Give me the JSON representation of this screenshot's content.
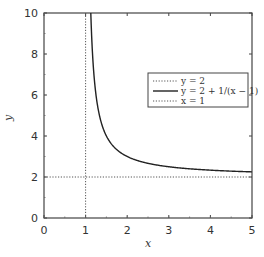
{
  "chart_data": {
    "type": "line",
    "title": "",
    "xlabel": "x",
    "ylabel": "y",
    "xlim": [
      0,
      5
    ],
    "ylim": [
      0,
      10
    ],
    "xticks": [
      0,
      1,
      2,
      3,
      4,
      5
    ],
    "yticks": [
      0,
      2,
      4,
      6,
      8,
      10
    ],
    "grid": false,
    "legend_position": "center-right inside",
    "series": [
      {
        "name": "y = 2",
        "style": "dotted",
        "color": "#555555",
        "kind": "hline",
        "value": 2
      },
      {
        "name": "y = 2 + 1/(x − 1)",
        "style": "solid",
        "color": "#222222",
        "kind": "function",
        "x_range": [
          1.125,
          5
        ]
      },
      {
        "name": "x = 1",
        "style": "dotted",
        "color": "#555555",
        "kind": "vline",
        "value": 1
      }
    ]
  },
  "legend": {
    "items": [
      "y = 2",
      "y = 2 + 1/(x − 1)",
      "x = 1"
    ]
  }
}
